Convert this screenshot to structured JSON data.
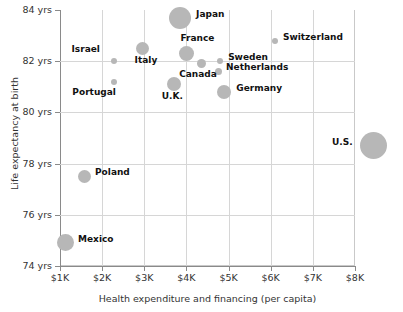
{
  "chart_data": {
    "type": "scatter",
    "title": "",
    "xlabel": "Health expenditure and financing (per capita)",
    "ylabel": "Life expectancy at birth",
    "xlim": [
      500,
      8800
    ],
    "ylim": [
      74,
      84
    ],
    "grid": true,
    "legend": "none",
    "bubble_color": "#b7b7b7",
    "xticks": [
      "$1K",
      "$2K",
      "$3K",
      "$4K",
      "$5K",
      "$6K",
      "$7K",
      "$8K"
    ],
    "xtick_values": [
      1000,
      2000,
      3000,
      4000,
      5000,
      6000,
      7000,
      8000
    ],
    "yticks": [
      "74 yrs",
      "76 yrs",
      "78 yrs",
      "80 yrs",
      "82 yrs",
      "84 yrs"
    ],
    "ytick_values": [
      74,
      76,
      78,
      80,
      82,
      84
    ],
    "points": [
      {
        "name": "Japan",
        "x": 3850,
        "y": 83.7,
        "size": 22,
        "label_dx": 16,
        "label_dy": -4
      },
      {
        "name": "Switzerland",
        "x": 6100,
        "y": 82.8,
        "size": 6,
        "label_dx": 8,
        "label_dy": -4
      },
      {
        "name": "Italy",
        "x": 2960,
        "y": 82.5,
        "size": 13,
        "label_dx": -8,
        "label_dy": 12
      },
      {
        "name": "France",
        "x": 4000,
        "y": 82.3,
        "size": 15,
        "label_dx": -6,
        "label_dy": -16
      },
      {
        "name": "Israel",
        "x": 2270,
        "y": 82.0,
        "size": 6,
        "label_dx": -42,
        "label_dy": -12
      },
      {
        "name": "Canada",
        "x": 4350,
        "y": 81.9,
        "size": 9,
        "label_dx": -22,
        "label_dy": 10
      },
      {
        "name": "Sweden",
        "x": 4800,
        "y": 82.0,
        "size": 6,
        "label_dx": 8,
        "label_dy": -4
      },
      {
        "name": "Netherlands",
        "x": 4750,
        "y": 81.6,
        "size": 7,
        "label_dx": 8,
        "label_dy": -4
      },
      {
        "name": "Portugal",
        "x": 2290,
        "y": 81.2,
        "size": 6,
        "label_dx": -42,
        "label_dy": 10
      },
      {
        "name": "U.K.",
        "x": 3700,
        "y": 81.1,
        "size": 14,
        "label_dx": -12,
        "label_dy": 12
      },
      {
        "name": "Germany",
        "x": 4900,
        "y": 80.8,
        "size": 14,
        "label_dx": 12,
        "label_dy": -4
      },
      {
        "name": "U.S.",
        "x": 8450,
        "y": 78.7,
        "size": 27,
        "label_dx": -42,
        "label_dy": -4
      },
      {
        "name": "Poland",
        "x": 1570,
        "y": 77.5,
        "size": 13,
        "label_dx": 11,
        "label_dy": -4
      },
      {
        "name": "Mexico",
        "x": 1120,
        "y": 74.9,
        "size": 17,
        "label_dx": 13,
        "label_dy": -4
      }
    ]
  }
}
